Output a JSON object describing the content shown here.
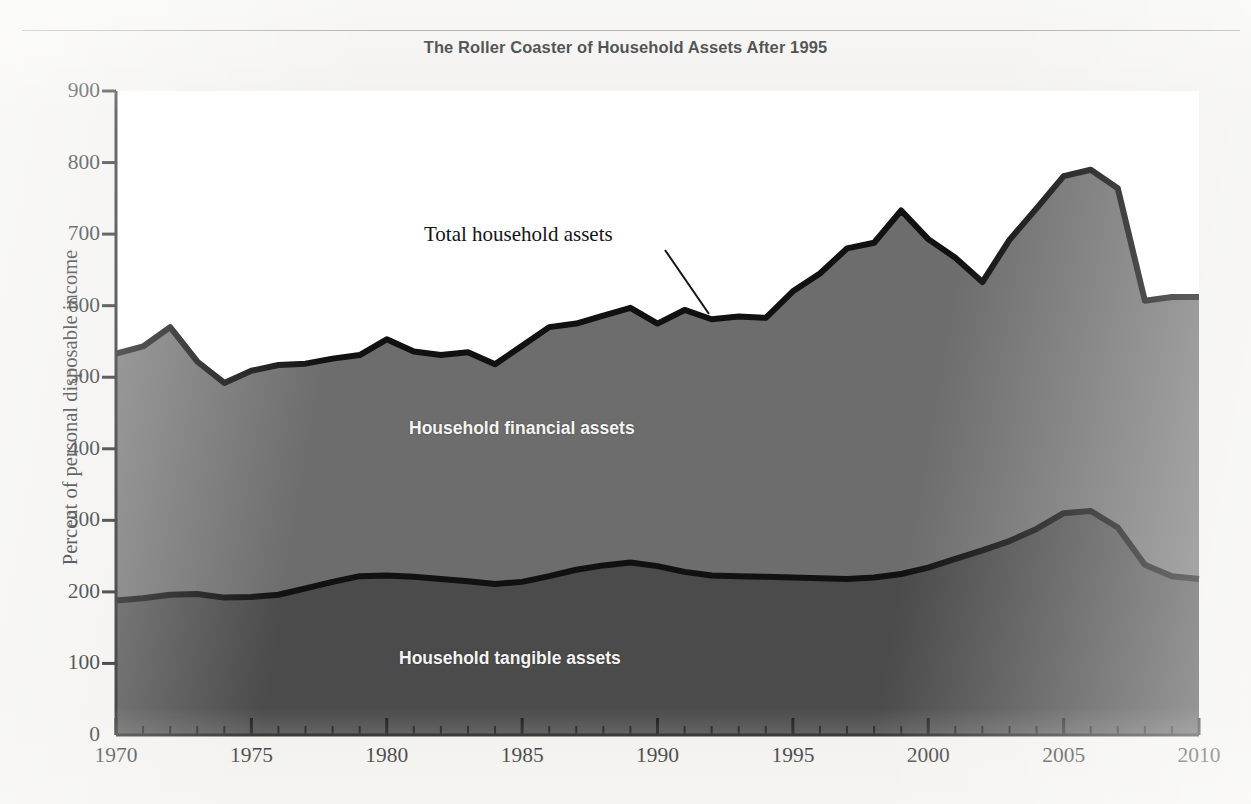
{
  "figure": {
    "title": "The Roller Coaster of Household Assets After 1995",
    "background_color": "#f2f1ee"
  },
  "axes": {
    "ylabel": "Percent of personal disposable income",
    "ytick_labels": [
      "900",
      "800",
      "700",
      "600",
      "500",
      "400",
      "300",
      "200",
      "100",
      "0"
    ],
    "xtick_labels": [
      "1970",
      "1975",
      "1980",
      "1985",
      "1990",
      "1995",
      "2000",
      "2005",
      "2010"
    ]
  },
  "annotations": {
    "total": "Total household assets",
    "financial": "Household financial assets",
    "tangible": "Household tangible assets"
  },
  "colors": {
    "tangible_fill": "#4b4b4b",
    "financial_fill": "#6d6d6d",
    "line": "#111111",
    "axis": "#1a1a1a",
    "plot_background": "#ffffff"
  },
  "chart_data": {
    "type": "area",
    "title": "The Roller Coaster of Household Assets After 1995",
    "xlabel": "",
    "ylabel": "Percent of personal disposable income",
    "xlim": [
      1970,
      2010
    ],
    "ylim": [
      0,
      900
    ],
    "stacked": true,
    "grid": false,
    "legend": "in-plot area labels",
    "x": [
      1970,
      1971,
      1972,
      1973,
      1974,
      1975,
      1976,
      1977,
      1978,
      1979,
      1980,
      1981,
      1982,
      1983,
      1984,
      1985,
      1986,
      1987,
      1988,
      1989,
      1990,
      1991,
      1992,
      1993,
      1994,
      1995,
      1996,
      1997,
      1998,
      1999,
      2000,
      2001,
      2002,
      2003,
      2004,
      2005,
      2006,
      2007,
      2008,
      2009,
      2010
    ],
    "series": [
      {
        "name": "Household tangible assets",
        "values": [
          188,
          191,
          196,
          197,
          192,
          193,
          196,
          205,
          214,
          222,
          223,
          221,
          218,
          215,
          211,
          214,
          222,
          231,
          237,
          241,
          236,
          228,
          223,
          222,
          221,
          220,
          219,
          218,
          220,
          225,
          234,
          246,
          258,
          271,
          288,
          310,
          313,
          290,
          238,
          222,
          218
        ]
      },
      {
        "name": "Household financial assets",
        "values": [
          345,
          352,
          374,
          325,
          300,
          316,
          321,
          314,
          312,
          309,
          330,
          315,
          313,
          320,
          307,
          330,
          348,
          344,
          349,
          356,
          339,
          366,
          358,
          363,
          362,
          400,
          426,
          462,
          468,
          508,
          459,
          421,
          375,
          421,
          448,
          471,
          477,
          474,
          369,
          390,
          394
        ]
      }
    ],
    "total": {
      "name": "Total household assets",
      "values": [
        533,
        543,
        570,
        522,
        492,
        509,
        517,
        519,
        526,
        531,
        553,
        536,
        531,
        535,
        518,
        544,
        570,
        575,
        586,
        597,
        575,
        594,
        581,
        585,
        583,
        620,
        645,
        680,
        688,
        733,
        693,
        667,
        633,
        692,
        736,
        781,
        790,
        764,
        607,
        612,
        612
      ]
    }
  }
}
